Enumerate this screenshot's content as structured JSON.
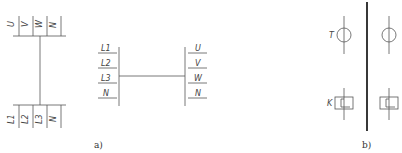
{
  "figure_a": {
    "caption": "a)",
    "vertical_form": {
      "top_terminals": [
        "U",
        "V",
        "W",
        "N"
      ],
      "bottom_terminals": [
        "L1",
        "L2",
        "L3",
        "N"
      ]
    },
    "horizontal_form": {
      "left_terminals": [
        "L1",
        "L2",
        "L3",
        "N"
      ],
      "right_terminals": [
        "U",
        "V",
        "W",
        "N"
      ]
    }
  },
  "figure_b": {
    "caption": "b)",
    "symbols": [
      {
        "type": "circle-terminal",
        "label": "T"
      },
      {
        "type": "circle-terminal",
        "label": ""
      },
      {
        "type": "box-terminal",
        "label": "K"
      },
      {
        "type": "box-terminal",
        "label": ""
      }
    ]
  }
}
